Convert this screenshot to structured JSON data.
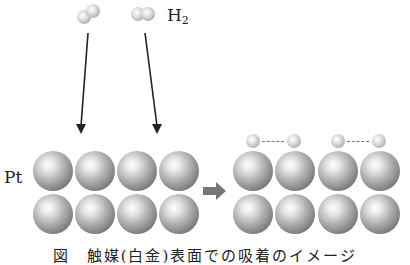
{
  "labels": {
    "molecule": "H",
    "molecule_subscript": "2",
    "metal": "Pt"
  },
  "caption": "図　触媒(白金)表面での吸着のイメージ",
  "colors": {
    "sphere_gray": "#9a9a9a",
    "arrow": "#222222",
    "process_arrow": "#777777"
  }
}
